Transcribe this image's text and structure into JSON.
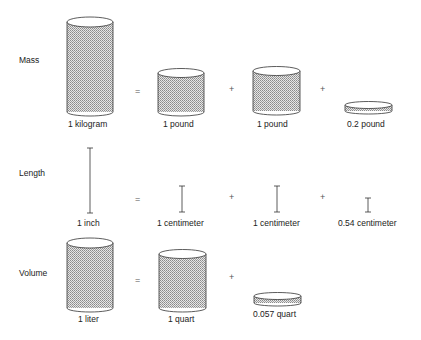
{
  "rows": {
    "mass": {
      "label": "Mass",
      "items": [
        {
          "label": "1 kilogram"
        },
        {
          "label": "1 pound"
        },
        {
          "label": "1 pound"
        },
        {
          "label": "0.2 pound"
        }
      ],
      "operators": [
        "=",
        "+",
        "+"
      ]
    },
    "length": {
      "label": "Length",
      "items": [
        {
          "label": "1 inch"
        },
        {
          "label": "1 centimeter"
        },
        {
          "label": "1 centimeter"
        },
        {
          "label": "0.54 centimeter"
        }
      ],
      "operators": [
        "=",
        "+",
        "+"
      ]
    },
    "volume": {
      "label": "Volume",
      "items": [
        {
          "label": "1 liter"
        },
        {
          "label": "1 quart"
        },
        {
          "label": "0.057 quart"
        }
      ],
      "operators": [
        "=",
        "+"
      ]
    }
  },
  "colors": {
    "fill": "#c8c8c8",
    "stroke": "#333333"
  }
}
